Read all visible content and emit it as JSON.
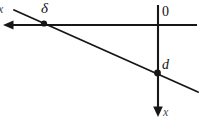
{
  "figure": {
    "type": "geometric-line-diagram",
    "background_color": "#ffffff",
    "stroke_color": "#171717",
    "labels": {
      "delta": "δ",
      "origin": "0",
      "depth": "d",
      "axis_down": "x",
      "axis_left": "x"
    },
    "geometry": {
      "horizontal_axis": {
        "name": "horizontal-axis-line",
        "from": [
          197,
          25
        ],
        "to": [
          5,
          25
        ],
        "arrow_at": "left"
      },
      "vertical_axis": {
        "name": "vertical-axis-line",
        "from": [
          158,
          5
        ],
        "to": [
          158,
          116
        ],
        "arrow_at": "bottom"
      },
      "diagonal": {
        "name": "diagonal-line",
        "from": [
          14,
          10
        ],
        "to": [
          198,
          92
        ],
        "arrow_at": "none"
      },
      "points": [
        {
          "name": "delta-intersection-point",
          "at": [
            44,
            24
          ]
        },
        {
          "name": "d-intersection-point",
          "at": [
            157,
            73
          ]
        }
      ]
    }
  }
}
